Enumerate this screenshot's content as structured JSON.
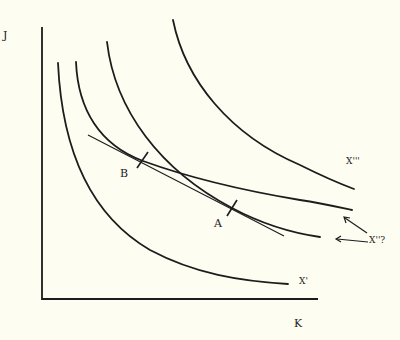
{
  "diagram": {
    "type": "indifference-curves / isoquant map",
    "axes": {
      "y_label": "J",
      "x_label": "K"
    },
    "curves": [
      {
        "id": "x1",
        "label": "X'"
      },
      {
        "id": "x2_upper",
        "label": "X''?"
      },
      {
        "id": "x2_lower",
        "label": "X''?"
      },
      {
        "id": "x3",
        "label": "X'''"
      }
    ],
    "points": [
      {
        "id": "A",
        "label": "A"
      },
      {
        "id": "B",
        "label": "B"
      }
    ],
    "labels": {
      "x1": "X'",
      "x2": "X''?",
      "x3": "X'''",
      "point_a": "A",
      "point_b": "B"
    },
    "colors": {
      "background": "#fdfdf1",
      "ink": "#1c1c1c"
    }
  }
}
